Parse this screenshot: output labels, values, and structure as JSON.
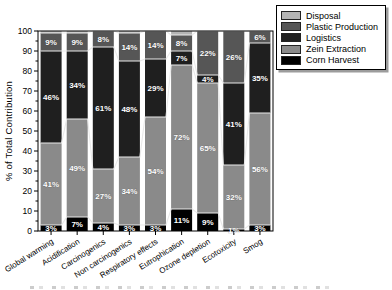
{
  "figure": {
    "background": "#ffffff",
    "axis_color": "#000000",
    "connector_line_color": "#e9e9e9",
    "segment_label_color": "#ffffff"
  },
  "chart_data": {
    "type": "bar",
    "stacked": true,
    "title": "",
    "xlabel": "",
    "ylabel": "% of Total Contribution",
    "ylim": [
      0,
      100
    ],
    "ytick_interval": 10,
    "minor_tick_interval": 5,
    "grid": false,
    "legend_position": "top-right",
    "categories": [
      "Global warming",
      "Acidification",
      "Carcinogenics",
      "Non carcinogenics",
      "Respiratory effects",
      "Eutrophication",
      "Ozone depletion",
      "Ecotoxicity",
      "Smog"
    ],
    "series": [
      {
        "name": "Corn Harvest",
        "color": "#000000",
        "labeled": true,
        "values": [
          3,
          7,
          4,
          3,
          3,
          11,
          9,
          1,
          3
        ]
      },
      {
        "name": "Zein Extraction",
        "color": "#8a8a8a",
        "labeled": true,
        "values": [
          41,
          49,
          27,
          34,
          54,
          72,
          65,
          32,
          56
        ]
      },
      {
        "name": "Logistics",
        "color": "#1f1f1f",
        "labeled": true,
        "values": [
          46,
          34,
          61,
          48,
          29,
          7,
          4,
          41,
          35
        ]
      },
      {
        "name": "Plastic Production",
        "color": "#565656",
        "labeled": true,
        "values": [
          9,
          9,
          8,
          14,
          14,
          8,
          22,
          26,
          6
        ]
      },
      {
        "name": "Disposal",
        "color": "#b4b4b4",
        "labeled": false,
        "values": [
          1,
          1,
          0,
          1,
          0,
          2,
          0,
          0,
          0
        ]
      }
    ],
    "segment_label_suffix": "%",
    "legend_entries": [
      "Disposal",
      "Plastic Production",
      "Logistics",
      "Zein Extraction",
      "Corn Harvest"
    ]
  }
}
